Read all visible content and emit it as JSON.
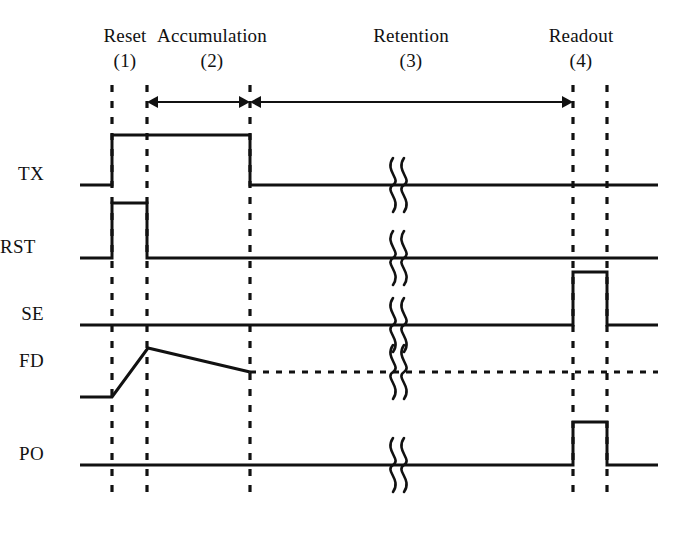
{
  "figure": {
    "type": "timing-diagram",
    "title_phases": [
      "Reset",
      "Accumulation",
      "Retention",
      "Readout"
    ]
  },
  "phases": [
    {
      "name": "Reset",
      "number": "(1)",
      "cx": 125,
      "span": [
        112,
        147
      ]
    },
    {
      "name": "Accumulation",
      "number": "(2)",
      "cx": 212,
      "span": [
        147,
        250
      ]
    },
    {
      "name": "Retention",
      "number": "(3)",
      "cx": 411,
      "span": [
        250,
        573
      ]
    },
    {
      "name": "Readout",
      "number": "(4)",
      "cx": 581,
      "span": [
        573,
        607
      ]
    }
  ],
  "markers": {
    "dashed_lines_x": [
      112,
      147,
      250,
      573,
      607
    ],
    "dashed_top_y": 85,
    "dashed_bottom_y": 497
  },
  "arrows": [
    {
      "name": "accumulation-span-arrow",
      "x1": 147,
      "x2": 250,
      "y": 102,
      "double_headed": true
    },
    {
      "name": "retention-span-arrow",
      "x1": 250,
      "x2": 573,
      "y": 102,
      "double_headed": true
    }
  ],
  "signals": [
    {
      "name": "TX",
      "label_x": 44,
      "label_y": 175,
      "baseline_y": 185,
      "high_y": 135,
      "style": "solid",
      "points": [
        [
          80,
          185
        ],
        [
          112,
          185
        ],
        [
          112,
          135
        ],
        [
          250,
          135
        ],
        [
          250,
          185
        ],
        [
          658,
          185
        ]
      ],
      "break_x": 400
    },
    {
      "name": "RST",
      "label_x": 27,
      "label_y": 248,
      "baseline_y": 258,
      "high_y": 203,
      "style": "solid",
      "points": [
        [
          80,
          258
        ],
        [
          112,
          258
        ],
        [
          112,
          203
        ],
        [
          147,
          203
        ],
        [
          147,
          258
        ],
        [
          658,
          258
        ]
      ],
      "break_x": 400
    },
    {
      "name": "SE",
      "label_x": 44,
      "label_y": 315,
      "baseline_y": 325,
      "high_y": 272,
      "style": "solid",
      "points": [
        [
          80,
          325
        ],
        [
          573,
          325
        ],
        [
          573,
          272
        ],
        [
          607,
          272
        ],
        [
          607,
          325
        ],
        [
          658,
          325
        ]
      ],
      "break_x": 400
    },
    {
      "name": "FD",
      "label_x": 44,
      "label_y": 362,
      "baseline_y": 397,
      "high_y": 348,
      "style": "ramp-dotted-tail",
      "points": [
        [
          80,
          397
        ],
        [
          112,
          397
        ],
        [
          148,
          348
        ],
        [
          250,
          372
        ]
      ],
      "dotted_tail": [
        [
          250,
          372
        ],
        [
          658,
          372
        ]
      ],
      "break_x": 400
    },
    {
      "name": "PO",
      "label_x": 44,
      "label_y": 455,
      "baseline_y": 465,
      "high_y": 422,
      "style": "solid",
      "points": [
        [
          80,
          465
        ],
        [
          573,
          465
        ],
        [
          573,
          422
        ],
        [
          607,
          422
        ],
        [
          607,
          465
        ],
        [
          658,
          465
        ]
      ],
      "break_x": 400
    }
  ],
  "colors": {
    "ink": "#111111",
    "background": "#ffffff"
  }
}
